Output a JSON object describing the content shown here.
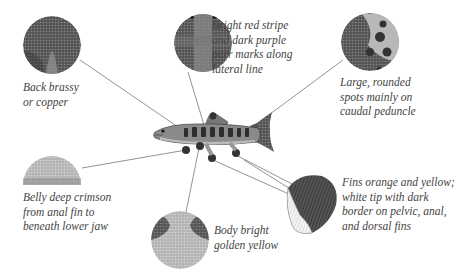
{
  "diagram": {
    "callouts": [
      {
        "id": "back",
        "lines": [
          "Back brassy",
          "or copper"
        ]
      },
      {
        "id": "stripe",
        "lines": [
          "Bright red stripe",
          "and dark purple",
          "parr marks along",
          "lateral line"
        ]
      },
      {
        "id": "spots",
        "lines": [
          "Large, rounded",
          "spots mainly on",
          "caudal peduncle"
        ]
      },
      {
        "id": "belly",
        "lines": [
          "Belly deep crimson",
          "from anal fin to",
          "beneath lower jaw"
        ]
      },
      {
        "id": "body",
        "lines": [
          "Body bright",
          "golden yellow"
        ]
      },
      {
        "id": "fins",
        "lines": [
          "Fins orange and yellow;",
          "white tip with dark",
          "border on pelvic, anal,",
          "and dorsal fins"
        ]
      }
    ]
  }
}
